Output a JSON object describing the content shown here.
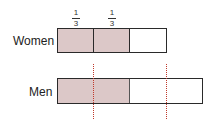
{
  "diagram": {
    "fractions": [
      {
        "numerator": "1",
        "denominator": "3"
      },
      {
        "numerator": "1",
        "denominator": "3"
      }
    ],
    "rows": [
      {
        "label": "Women",
        "segments": 3,
        "shaded": 2
      },
      {
        "label": "Men",
        "segments": 1,
        "shaded_fraction": "shaded to 2/3 of women's length"
      }
    ],
    "colors": {
      "shade": "#dcc8c8",
      "border": "#2a2a2a",
      "dotted": "#c0392b"
    }
  }
}
